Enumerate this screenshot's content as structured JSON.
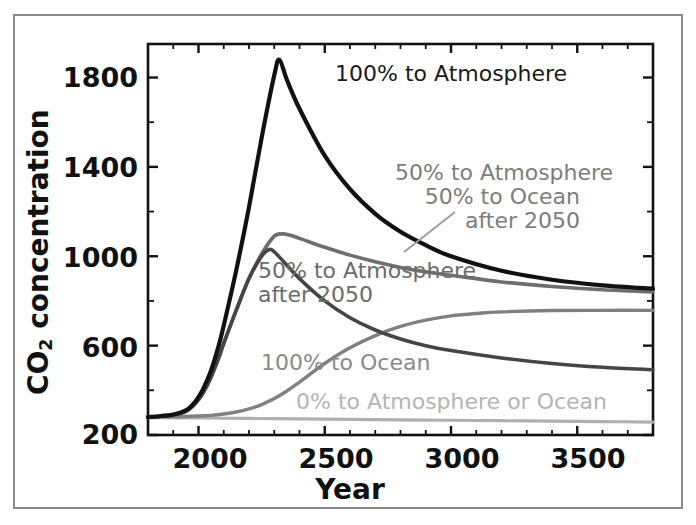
{
  "figure": {
    "name": "co2-concentration-projection-chart",
    "background": "#ffffff",
    "frame_color": "#8a8a8a"
  },
  "chart_data": {
    "type": "line",
    "title": "",
    "xlabel": "Year",
    "ylabel": "CO2 concentration",
    "ylabel_html": "CO<sub>2</sub> concentration",
    "xlim": [
      1800,
      3800
    ],
    "ylim": [
      200,
      1950
    ],
    "xticks": [
      2000,
      2500,
      3000,
      3500
    ],
    "xtick_labels": [
      "2000",
      "2500",
      "3000",
      "3500"
    ],
    "yticks": [
      200,
      600,
      1000,
      1400,
      1800
    ],
    "ytick_labels": [
      "200",
      "600",
      "1000",
      "1400",
      "1800"
    ],
    "minor_yticks": [
      400,
      800,
      1200,
      1600
    ],
    "grid": false,
    "legend": "inline-annotations",
    "series": [
      {
        "name": "100% to Atmosphere",
        "color": "#111111",
        "width": 4.2,
        "x": [
          1800,
          1850,
          1900,
          1950,
          1980,
          2000,
          2020,
          2050,
          2080,
          2100,
          2150,
          2200,
          2250,
          2300,
          2320,
          2350,
          2400,
          2500,
          2600,
          2700,
          2800,
          2900,
          3000,
          3200,
          3400,
          3600,
          3800
        ],
        "y": [
          280,
          285,
          292,
          310,
          340,
          370,
          410,
          490,
          600,
          690,
          940,
          1220,
          1530,
          1810,
          1880,
          1790,
          1660,
          1450,
          1300,
          1190,
          1110,
          1050,
          1000,
          935,
          895,
          870,
          855
        ]
      },
      {
        "name": "50% to Atmosphere 50% to Ocean after 2050",
        "color": "#6e6e6e",
        "width": 3.6,
        "x": [
          1800,
          1850,
          1900,
          1950,
          1980,
          2000,
          2020,
          2050,
          2080,
          2100,
          2150,
          2200,
          2250,
          2300,
          2330,
          2360,
          2400,
          2500,
          2600,
          2700,
          2800,
          2900,
          3000,
          3200,
          3400,
          3600,
          3800
        ],
        "y": [
          280,
          284,
          290,
          306,
          332,
          358,
          392,
          460,
          545,
          610,
          760,
          900,
          1010,
          1090,
          1100,
          1095,
          1080,
          1040,
          1005,
          975,
          950,
          930,
          915,
          885,
          865,
          850,
          840
        ]
      },
      {
        "name": "50% to Atmosphere after 2050",
        "color": "#454545",
        "width": 3.6,
        "x": [
          1800,
          1850,
          1900,
          1950,
          1980,
          2000,
          2020,
          2050,
          2080,
          2100,
          2150,
          2200,
          2250,
          2280,
          2300,
          2330,
          2400,
          2500,
          2600,
          2700,
          2800,
          2900,
          3000,
          3200,
          3400,
          3600,
          3800
        ],
        "y": [
          280,
          284,
          290,
          306,
          332,
          358,
          392,
          460,
          545,
          610,
          760,
          900,
          1000,
          1030,
          1020,
          985,
          900,
          800,
          725,
          670,
          630,
          600,
          578,
          545,
          520,
          503,
          492
        ]
      },
      {
        "name": "100% to Ocean",
        "color": "#808080",
        "width": 3.4,
        "x": [
          1800,
          1900,
          2000,
          2050,
          2100,
          2150,
          2200,
          2250,
          2300,
          2350,
          2400,
          2500,
          2600,
          2700,
          2800,
          2900,
          3000,
          3100,
          3200,
          3400,
          3600,
          3800
        ],
        "y": [
          280,
          282,
          285,
          288,
          294,
          303,
          317,
          336,
          363,
          397,
          437,
          520,
          590,
          645,
          686,
          714,
          733,
          744,
          751,
          757,
          758,
          758
        ]
      },
      {
        "name": "0% to Atmosphere or Ocean",
        "color": "#b0b0b0",
        "width": 3.2,
        "x": [
          1800,
          2000,
          2200,
          2400,
          2600,
          2800,
          3000,
          3200,
          3400,
          3600,
          3800
        ],
        "y": [
          278,
          276,
          274,
          272,
          270,
          268,
          266,
          264,
          262,
          260,
          258
        ]
      }
    ],
    "annotations": [
      {
        "id": "ann-100-atmosphere",
        "text": "100% to Atmosphere",
        "color": "#1a1a1a",
        "align": "left",
        "leader": false
      },
      {
        "id": "ann-50-atmosphere-50-ocean",
        "text": "50% to Atmosphere\n50% to Ocean\nafter 2050",
        "color": "#7d7d7d",
        "align": "right",
        "leader": true
      },
      {
        "id": "ann-50-atmosphere",
        "text": "50% to Atmosphere\nafter 2050",
        "color": "#6b6b6b",
        "align": "left",
        "leader": false
      },
      {
        "id": "ann-100-ocean",
        "text": "100% to Ocean",
        "color": "#8a8a8a",
        "align": "left",
        "leader": false
      },
      {
        "id": "ann-0-atmosphere-ocean",
        "text": "0% to Atmosphere or Ocean",
        "color": "#b4b4b4",
        "align": "left",
        "leader": false
      }
    ]
  }
}
